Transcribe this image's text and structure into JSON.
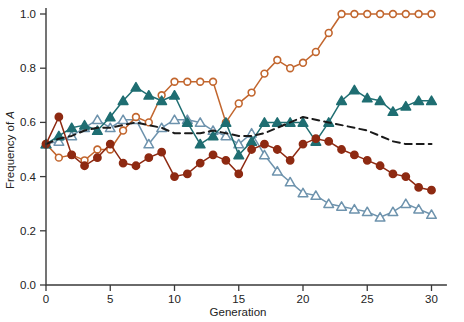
{
  "chart_data": {
    "type": "line",
    "title": "",
    "xlabel": "Generation",
    "ylabel": "Frequency of A",
    "xlim": [
      0,
      31
    ],
    "ylim": [
      0.0,
      1.05
    ],
    "grid": false,
    "legend_position": "none",
    "xticks": [
      0,
      5,
      10,
      15,
      20,
      25,
      30
    ],
    "xtick_labels": [
      "0",
      "5",
      "10",
      "15",
      "20",
      "25",
      "30"
    ],
    "yticks": [
      0.0,
      0.2,
      0.4,
      0.6,
      0.8,
      1.0
    ],
    "ytick_labels": [
      "0.0",
      "0.2",
      "0.4",
      "0.6",
      "0.8",
      "1.0"
    ],
    "x": [
      0,
      1,
      2,
      3,
      4,
      5,
      6,
      7,
      8,
      9,
      10,
      11,
      12,
      13,
      14,
      15,
      16,
      17,
      18,
      19,
      20,
      21,
      22,
      23,
      24,
      25,
      26,
      27,
      28,
      29,
      30
    ],
    "series": [
      {
        "name": "orange-open-circle",
        "marker": "circle-open",
        "color": "#C2662E",
        "fill": "#FFFFFF",
        "linestyle": "solid",
        "values": [
          0.52,
          0.47,
          0.48,
          0.46,
          0.5,
          0.5,
          0.57,
          0.62,
          0.6,
          0.7,
          0.75,
          0.75,
          0.75,
          0.75,
          0.6,
          0.67,
          0.71,
          0.78,
          0.83,
          0.8,
          0.82,
          0.86,
          0.93,
          1.0,
          1.0,
          1.0,
          1.0,
          1.0,
          1.0,
          1.0,
          1.0
        ]
      },
      {
        "name": "teal-filled-triangle",
        "marker": "triangle-filled",
        "color": "#1F6E72",
        "fill": "#1F6E72",
        "linestyle": "solid",
        "values": [
          0.52,
          0.55,
          0.58,
          0.59,
          0.57,
          0.62,
          0.68,
          0.73,
          0.7,
          0.68,
          0.7,
          0.6,
          0.52,
          0.55,
          0.6,
          0.48,
          0.53,
          0.6,
          0.6,
          0.6,
          0.6,
          0.53,
          0.6,
          0.68,
          0.72,
          0.69,
          0.68,
          0.64,
          0.66,
          0.68,
          0.68
        ]
      },
      {
        "name": "blue-open-triangle",
        "marker": "triangle-open",
        "color": "#6E93AD",
        "fill": "#FFFFFF",
        "linestyle": "solid",
        "values": [
          0.52,
          0.53,
          0.55,
          0.58,
          0.61,
          0.58,
          0.61,
          0.61,
          0.52,
          0.58,
          0.61,
          0.61,
          0.6,
          0.57,
          0.55,
          0.52,
          0.56,
          0.48,
          0.42,
          0.38,
          0.34,
          0.33,
          0.3,
          0.29,
          0.28,
          0.27,
          0.25,
          0.27,
          0.3,
          0.28,
          0.26
        ]
      },
      {
        "name": "darkred-filled-circle",
        "marker": "circle-filled",
        "color": "#8E2A12",
        "fill": "#8E2A12",
        "linestyle": "solid",
        "values": [
          0.52,
          0.62,
          0.48,
          0.44,
          0.47,
          0.52,
          0.45,
          0.44,
          0.47,
          0.49,
          0.4,
          0.41,
          0.45,
          0.48,
          0.46,
          0.41,
          0.5,
          0.52,
          0.5,
          0.46,
          0.52,
          0.54,
          0.53,
          0.5,
          0.48,
          0.46,
          0.44,
          0.41,
          0.4,
          0.36,
          0.35
        ]
      },
      {
        "name": "mean-dashed",
        "marker": "none",
        "color": "#1A1A1A",
        "fill": "none",
        "linestyle": "dashed",
        "values": [
          0.52,
          0.54,
          0.55,
          0.57,
          0.58,
          0.58,
          0.59,
          0.6,
          0.59,
          0.58,
          0.56,
          0.56,
          0.56,
          0.57,
          0.56,
          0.55,
          0.55,
          0.56,
          0.58,
          0.6,
          0.62,
          0.61,
          0.6,
          0.59,
          0.58,
          0.57,
          0.55,
          0.53,
          0.52,
          0.52,
          0.52
        ]
      }
    ]
  },
  "figure": {
    "background": "#FFFFFF",
    "axis_color": "#3A3A3A"
  }
}
